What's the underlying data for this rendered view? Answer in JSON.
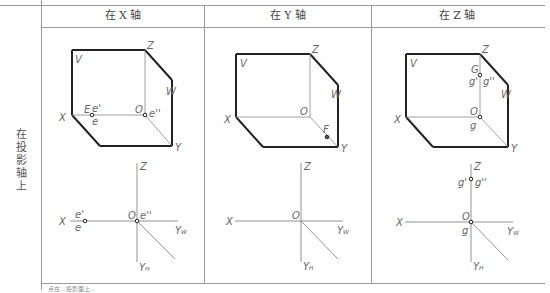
{
  "table": {
    "row_label": "在投影轴上",
    "headers": [
      "在 X 轴",
      "在 Y 轴",
      "在 Z 轴"
    ],
    "footer_partial": "点在...投影面上..."
  },
  "panels": [
    {
      "name": "x-axis",
      "cube_labels": {
        "V": "V",
        "W": "W",
        "H": "H",
        "X": "X",
        "Y": "Y",
        "Z": "Z",
        "O": "O"
      },
      "point_labels": [
        "E",
        "e'",
        "e",
        "e''"
      ],
      "projection_labels": {
        "X": "X",
        "Z": "Z",
        "O": "O",
        "YW": "Y",
        "YW_sub": "W",
        "YH": "Y",
        "YH_sub": "H",
        "points": [
          "e'",
          "e",
          "e''"
        ]
      }
    },
    {
      "name": "y-axis",
      "cube_labels": {
        "V": "V",
        "W": "W",
        "H": "H",
        "X": "X",
        "Y": "Y",
        "Z": "Z",
        "O": "O"
      },
      "point_labels": [
        "F"
      ],
      "projection_labels": {
        "X": "X",
        "Z": "Z",
        "O": "O",
        "YW": "Y",
        "YW_sub": "W",
        "YH": "Y",
        "YH_sub": "H",
        "points": []
      }
    },
    {
      "name": "z-axis",
      "cube_labels": {
        "V": "V",
        "W": "W",
        "H": "H",
        "X": "X",
        "Y": "Y",
        "Z": "Z",
        "O": "O"
      },
      "point_labels": [
        "G",
        "g'",
        "g''",
        "g"
      ],
      "projection_labels": {
        "X": "X",
        "Z": "Z",
        "O": "O",
        "YW": "Y",
        "YW_sub": "W",
        "YH": "Y",
        "YH_sub": "H",
        "points": [
          "g'",
          "g''",
          "g"
        ]
      }
    }
  ]
}
